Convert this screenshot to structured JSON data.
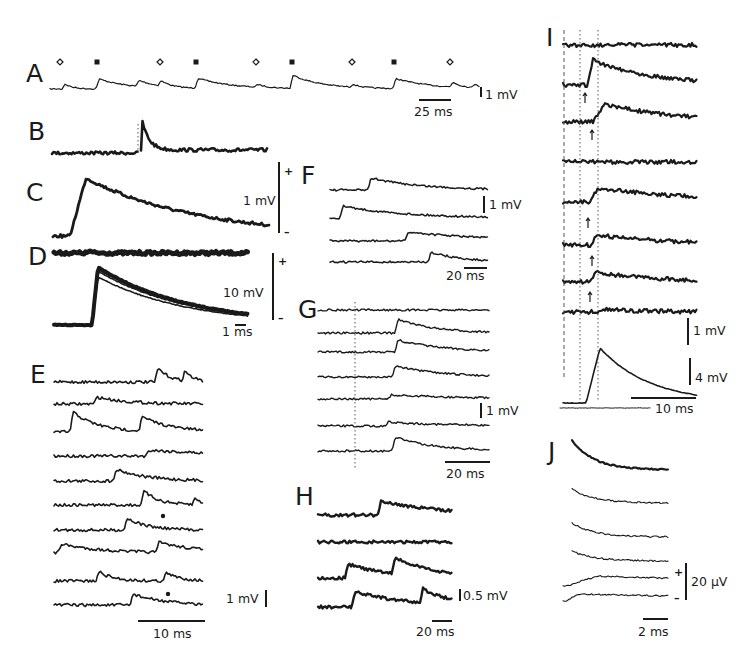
{
  "figure": {
    "type": "electrophysiology multi-panel figure",
    "panels": [
      {
        "id": "A",
        "label": "A",
        "scale_v": "1 mV",
        "scale_t": "25 ms",
        "markers": [
          "open-diamond",
          "filled-square",
          "open-diamond",
          "filled-square",
          "open-diamond",
          "filled-square",
          "open-diamond",
          "filled-square",
          "open-diamond"
        ]
      },
      {
        "id": "B",
        "label": "B"
      },
      {
        "id": "C",
        "label": "C",
        "scale_v": "1 mV",
        "plus": "+",
        "minus": "–"
      },
      {
        "id": "D",
        "label": "D",
        "scale_v": "10 mV",
        "scale_t": "1 ms",
        "plus": "+",
        "minus": "–"
      },
      {
        "id": "E",
        "label": "E",
        "scale_v": "1 mV",
        "scale_t": "10 ms",
        "trace_count": 10,
        "marked_traces": [
          7,
          10
        ]
      },
      {
        "id": "F",
        "label": "F",
        "scale_v": "1 mV",
        "scale_t": "20 ms",
        "trace_count": 4
      },
      {
        "id": "G",
        "label": "G",
        "scale_v": "1 mV",
        "scale_t": "20 ms",
        "trace_count": 7
      },
      {
        "id": "H",
        "label": "H",
        "scale_v": "0.5 mV",
        "scale_t": "20 ms",
        "trace_count": 4
      },
      {
        "id": "I",
        "label": "I",
        "scale_v": "1 mV",
        "scale_v2": "4 mV",
        "scale_t": "10 ms",
        "trace_count": 8,
        "arrow_traces": [
          2,
          3,
          5,
          6,
          7
        ]
      },
      {
        "id": "J",
        "label": "J",
        "scale_v": "20 µV",
        "scale_t": "2 ms",
        "trace_count": 6,
        "plus": "+",
        "minus": "–"
      }
    ]
  },
  "colors": {
    "ink": "#1a1a1a",
    "paper": "#ffffff",
    "guide": "#555555"
  }
}
